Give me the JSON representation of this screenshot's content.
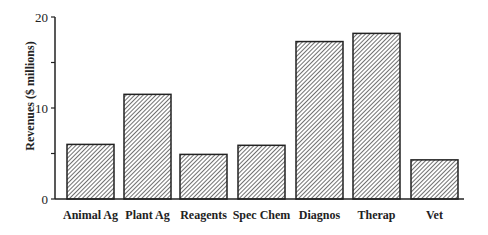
{
  "chart_data": {
    "type": "bar",
    "title": "",
    "xlabel": "",
    "ylabel": "Revenues ($ millions)",
    "ylim": [
      0,
      20
    ],
    "yticks": [
      0,
      5,
      10,
      15,
      20
    ],
    "ytick_labels": [
      "0",
      "",
      "10",
      "",
      "20"
    ],
    "grid": false,
    "legend": null,
    "categories": [
      "Animal Ag",
      "Plant Ag",
      "Reagents",
      "Spec Chem",
      "Diagnos",
      "Therap",
      "Vet"
    ],
    "values": [
      6.0,
      11.5,
      4.9,
      5.9,
      17.3,
      18.2,
      4.3
    ],
    "bar_style": "diagonal hatch",
    "colors": {
      "stroke": "#222222",
      "hatch": "#333333",
      "background": "#ffffff"
    }
  }
}
